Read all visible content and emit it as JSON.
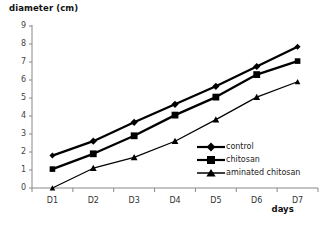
{
  "chart_data": {
    "type": "line",
    "title": "",
    "ylabel": "diameter (cm)",
    "xlabel": "days",
    "categories": [
      "D1",
      "D2",
      "D3",
      "D4",
      "D5",
      "D6",
      "D7"
    ],
    "ylim": [
      0,
      9
    ],
    "yticks": [
      0,
      1,
      2,
      3,
      4,
      5,
      6,
      7,
      8,
      9
    ],
    "grid": false,
    "legend_position": "inside-lower-right",
    "series": [
      {
        "name": "control",
        "marker": "diamond",
        "color": "#000000",
        "values": [
          1.8,
          2.6,
          3.65,
          4.65,
          5.65,
          6.75,
          7.85
        ]
      },
      {
        "name": "chitosan",
        "marker": "square",
        "color": "#000000",
        "values": [
          1.05,
          1.9,
          2.9,
          4.05,
          5.05,
          6.3,
          7.05
        ]
      },
      {
        "name": "aminated chitosan",
        "marker": "triangle",
        "color": "#000000",
        "values": [
          0.0,
          1.1,
          1.7,
          2.6,
          3.8,
          5.05,
          5.9
        ]
      }
    ]
  },
  "axis": {
    "y_title": "diameter (cm)",
    "x_title": "days",
    "y_labels": [
      "9",
      "8",
      "7",
      "6",
      "5",
      "4",
      "3",
      "2",
      "1",
      "0"
    ],
    "x_labels": [
      "D1",
      "D2",
      "D3",
      "D4",
      "D5",
      "D6",
      "D7"
    ]
  },
  "legend": {
    "items": [
      {
        "label": "control"
      },
      {
        "label": "chitosan"
      },
      {
        "label": "aminated chitosan"
      }
    ]
  }
}
